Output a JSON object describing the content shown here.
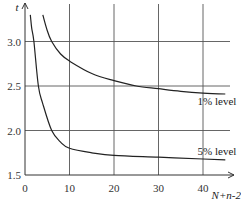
{
  "chart_data": {
    "type": "line",
    "title": "",
    "xlabel": "N+n-2",
    "ylabel": "t",
    "xlim": [
      0,
      45
    ],
    "ylim": [
      1.5,
      3.3
    ],
    "grid": true,
    "x_ticks": [
      "0",
      "10",
      "20",
      "30",
      "40"
    ],
    "y_ticks": [
      "1.5",
      "2.0",
      "2.5",
      "3.0"
    ],
    "series": [
      {
        "name": "1% level",
        "x": [
          4,
          5,
          6,
          8,
          10,
          15,
          20,
          25,
          30,
          35,
          40,
          45
        ],
        "values": [
          3.3,
          3.12,
          3.0,
          2.86,
          2.78,
          2.64,
          2.56,
          2.5,
          2.47,
          2.44,
          2.42,
          2.41
        ]
      },
      {
        "name": "5% level",
        "x": [
          1.2,
          1.5,
          2,
          3,
          4,
          6,
          8,
          10,
          15,
          20,
          30,
          40,
          45
        ],
        "values": [
          3.3,
          3.15,
          3.0,
          2.5,
          2.3,
          2.0,
          1.87,
          1.8,
          1.75,
          1.72,
          1.7,
          1.68,
          1.67
        ]
      }
    ],
    "annotations": [
      {
        "text": "1% level",
        "x": 40,
        "y": 2.33
      },
      {
        "text": "5% level",
        "x": 40,
        "y": 1.77
      }
    ]
  }
}
